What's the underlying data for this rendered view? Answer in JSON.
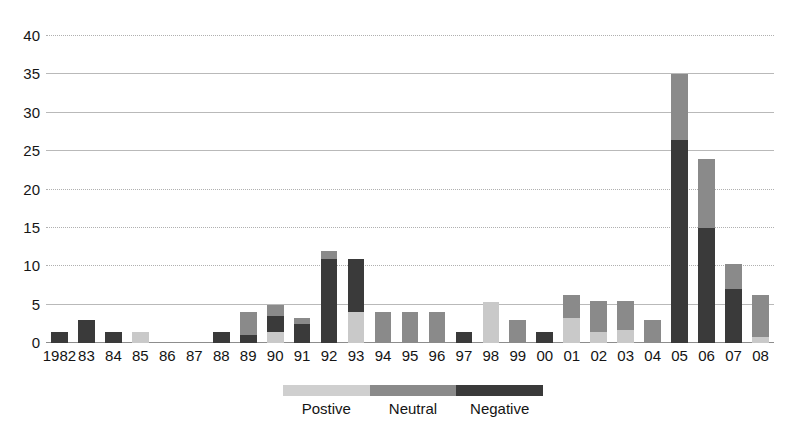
{
  "chart_data": {
    "type": "bar",
    "subtype": "stacked-vertical",
    "title": "",
    "subtitle": "",
    "xlabel": "",
    "ylabel": "",
    "ylim": [
      0,
      40
    ],
    "ytick_step": 5,
    "grid": true,
    "grid_axis": "y",
    "legend_position": "bottom",
    "categories": [
      "1982",
      "83",
      "84",
      "85",
      "86",
      "87",
      "88",
      "89",
      "90",
      "91",
      "92",
      "93",
      "94",
      "95",
      "96",
      "97",
      "98",
      "99",
      "00",
      "01",
      "02",
      "03",
      "04",
      "05",
      "06",
      "07",
      "08"
    ],
    "ytick_labels": [
      "0",
      "5",
      "10",
      "15",
      "20",
      "25",
      "30",
      "35",
      "40"
    ],
    "ytick_values": [
      0,
      5,
      10,
      15,
      20,
      25,
      30,
      35,
      40
    ],
    "series": [
      {
        "name": "Postive",
        "color": "#c9c9c9",
        "values": [
          0,
          0,
          0,
          1.5,
          0,
          0,
          0,
          0,
          1.5,
          0,
          0,
          4,
          0,
          0,
          0,
          0,
          5.3,
          0,
          0,
          3.2,
          1.5,
          1.7,
          0,
          0,
          0,
          0,
          0.8
        ]
      },
      {
        "name": "Neutral",
        "color": "#8a8a8a",
        "values": [
          0,
          0,
          0,
          0,
          0,
          0,
          0,
          3,
          1.5,
          0.8,
          1,
          0,
          4,
          4,
          4,
          0,
          0,
          3,
          0,
          3.1,
          4,
          3.8,
          3,
          8.5,
          9,
          3.3,
          5.5
        ]
      },
      {
        "name": "Negative",
        "color": "#3a3a3a",
        "values": [
          1.5,
          3,
          1.5,
          0,
          0,
          0,
          1.5,
          1,
          2,
          2.5,
          11,
          7,
          0,
          0,
          0,
          1.5,
          0,
          0,
          1.5,
          0,
          0,
          0,
          0,
          26.5,
          15,
          7,
          0
        ]
      }
    ],
    "totals": [
      1.5,
      3,
      1.5,
      1.5,
      0,
      0,
      1.5,
      4,
      5,
      3.3,
      12,
      11,
      4,
      4,
      4,
      1.5,
      5.3,
      3,
      1.5,
      6.3,
      5.5,
      5.5,
      3,
      35,
      24,
      10.3,
      6.3
    ]
  },
  "legend": {
    "items": [
      {
        "label": "Postive",
        "color": "#cfcfcf"
      },
      {
        "label": "Neutral",
        "color": "#8a8a8a"
      },
      {
        "label": "Negative",
        "color": "#3a3a3a"
      }
    ]
  },
  "colors": {
    "positive": "#c9c9c9",
    "neutral": "#8a8a8a",
    "negative": "#3a3a3a",
    "gridline": "#b9b9b9",
    "background": "#ffffff",
    "text": "#141414"
  }
}
